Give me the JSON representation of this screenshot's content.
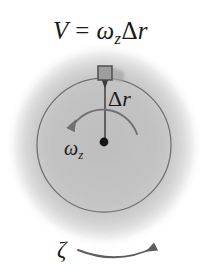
{
  "figure": {
    "background_color": "#ffffff",
    "disk_fill_color": "#c3c3c3",
    "disk_edge_color": "#f0f0f0",
    "circle_stroke_color": "#6d6d6d",
    "arrow_color": "#6a6a6a",
    "text_color": "#1a1a1a",
    "block_fill_color": "#9a9a9a",
    "block_edge_color": "#4a4a4a",
    "center_dot_color": "#151515"
  },
  "labels": {
    "velocity_equation": {
      "text": "V = ωzΔr",
      "symbol_v": "V",
      "equals": " = ",
      "omega": "ω",
      "omega_subscript": "z",
      "delta": "Δ",
      "radius": "r"
    },
    "delta_r": {
      "text": "Δr",
      "delta": "Δ",
      "radius": "r"
    },
    "omega_z": {
      "text": "ωz",
      "omega": "ω",
      "subscript": "z"
    },
    "zeta": {
      "text": "ζ"
    }
  },
  "geometry": {
    "blob_center": {
      "x": 104,
      "y": 146
    },
    "blob_radius_x": 96,
    "blob_radius_y": 100,
    "inner_circle": {
      "cx": 104,
      "cy": 145,
      "r": 67
    },
    "center_dot": {
      "cx": 104,
      "cy": 142,
      "r": 4
    },
    "block": {
      "x": 98,
      "y": 66,
      "w": 14,
      "h": 14
    },
    "velocity_arrow": {
      "x_tail": 133,
      "x_head": 55,
      "y": 59
    },
    "delta_r_arrow": {
      "x": 105,
      "y_tail": 140,
      "y_head": 80
    },
    "omega_arc": {
      "cx": 104,
      "cy": 142,
      "r": 38,
      "start_deg": -12,
      "end_deg": 196
    },
    "zeta_arc": {
      "x_start": 78,
      "x_end": 158,
      "y": 254,
      "sag": 9
    }
  }
}
